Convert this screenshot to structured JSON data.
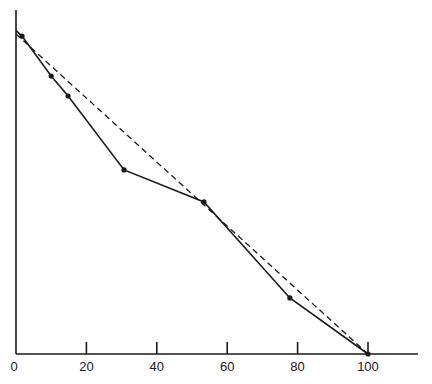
{
  "chart_data": {
    "type": "line",
    "title": "",
    "xlabel": "",
    "ylabel": "",
    "xlim": [
      0,
      115
    ],
    "ylim": [
      0,
      100
    ],
    "grid": false,
    "legend": null,
    "x_ticks": [
      0,
      20,
      40,
      60,
      80,
      100
    ],
    "x_tick_labels": [
      "0",
      "20",
      "40",
      "60",
      "80",
      "100"
    ],
    "series": [
      {
        "name": "observed",
        "style": "solid",
        "markers": true,
        "x": [
          0,
          1.7,
          10,
          14.8,
          30.7,
          53.4,
          77.8,
          100
        ],
        "y": [
          94,
          92.4,
          80.8,
          75.0,
          53.5,
          44.2,
          16.3,
          0
        ]
      },
      {
        "name": "linear reference",
        "style": "dashed",
        "markers": false,
        "x": [
          0,
          100
        ],
        "y": [
          93,
          0
        ]
      }
    ]
  }
}
